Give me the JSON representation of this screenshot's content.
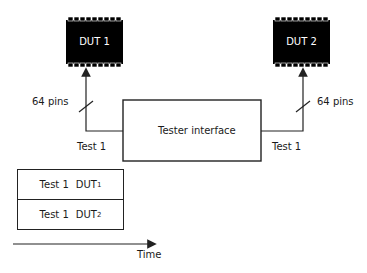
{
  "diagram": {
    "duts": [
      {
        "label": "DUT 1"
      },
      {
        "label": "DUT 2"
      }
    ],
    "buses": [
      {
        "label": "64 pins"
      },
      {
        "label": "64 pins"
      }
    ],
    "tester": {
      "label": "Tester interface"
    },
    "test_labels": [
      {
        "label": "Test 1"
      },
      {
        "label": "Test 1"
      }
    ],
    "timeline": {
      "rows": [
        {
          "test": "Test 1",
          "dut": "DUT",
          "sub": "1"
        },
        {
          "test": "Test 1",
          "dut": "DUT",
          "sub": "2"
        }
      ],
      "axis_label": "Time"
    },
    "colors": {
      "chip": "#000000",
      "line": "#222222",
      "text": "#1a1a1a"
    }
  }
}
